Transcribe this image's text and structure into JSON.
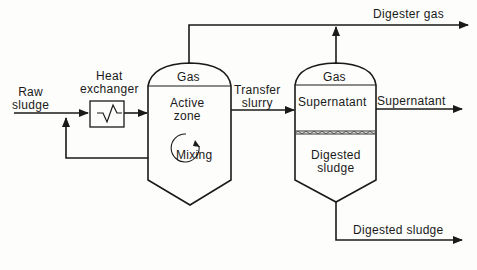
{
  "diagram": {
    "inputs": {
      "raw_sludge": [
        "Raw",
        "sludge"
      ]
    },
    "heat_exchanger": [
      "Heat",
      "exchanger"
    ],
    "tank1": {
      "gas": "Gas",
      "zone": [
        "Active",
        "zone"
      ],
      "mixing": "Mixing"
    },
    "transfer": [
      "Transfer",
      "slurry"
    ],
    "tank2": {
      "gas": "Gas",
      "supernatant": "Supernatant",
      "sludge": [
        "Digested",
        "sludge"
      ]
    },
    "outputs": {
      "digester_gas": "Digester gas",
      "supernatant": "Supernatant",
      "digested_sludge": "Digested sludge"
    },
    "colors": {
      "line": "#1a1a1a",
      "background": "#fdfdfb"
    }
  }
}
